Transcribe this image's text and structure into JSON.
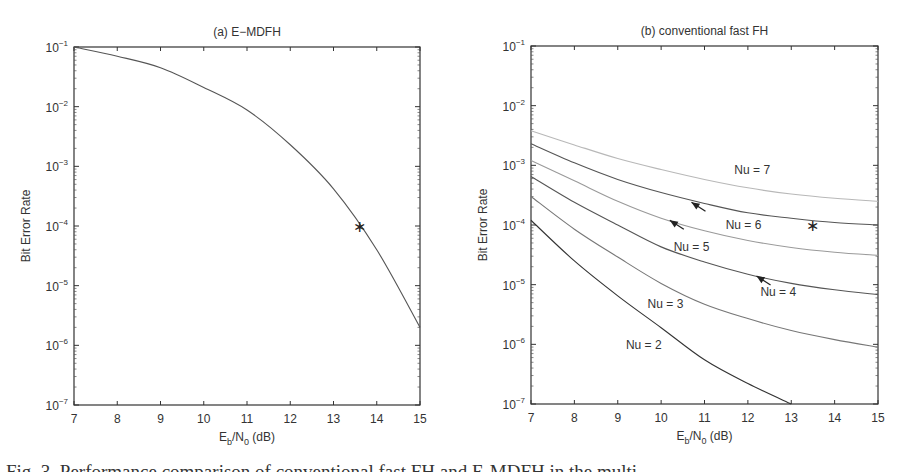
{
  "figure": {
    "caption_partial": "Fig. 3.  Performance comparison of conventional fast FH and E-MDFH in the multi"
  },
  "chart_data": [
    {
      "type": "line",
      "title": "(a) E−MDFH",
      "xlabel": "E_b/N_0 (dB)",
      "ylabel": "Bit Error Rate",
      "xlim": [
        7,
        15
      ],
      "ylim": [
        1e-07,
        0.1
      ],
      "yscale": "log",
      "grid": false,
      "xticks": [
        "7",
        "8",
        "9",
        "10",
        "11",
        "12",
        "13",
        "14",
        "15"
      ],
      "yticks": [
        "10^-1",
        "10^-2",
        "10^-3",
        "10^-4",
        "10^-5",
        "10^-6",
        "10^-7"
      ],
      "series": [
        {
          "name": "E-MDFH",
          "color": "#555555",
          "x": [
            7,
            8,
            9,
            10,
            11,
            12,
            13,
            14,
            15
          ],
          "values": [
            0.1,
            0.07,
            0.045,
            0.021,
            0.0088,
            0.0023,
            0.00042,
            4e-05,
            2e-06
          ]
        }
      ],
      "markers": [
        {
          "x": 13.6,
          "y": 0.0001,
          "symbol": "*"
        }
      ]
    },
    {
      "type": "line",
      "title": "(b) conventional fast FH",
      "xlabel": "E_b/N_0 (dB)",
      "ylabel": "Bit Error Rate",
      "xlim": [
        7,
        15
      ],
      "ylim": [
        1e-07,
        0.1
      ],
      "yscale": "log",
      "grid": false,
      "xticks": [
        "7",
        "8",
        "9",
        "10",
        "11",
        "12",
        "13",
        "14",
        "15"
      ],
      "yticks": [
        "10^-1",
        "10^-2",
        "10^-3",
        "10^-4",
        "10^-5",
        "10^-6",
        "10^-7"
      ],
      "series": [
        {
          "name": "Nu = 7",
          "color": "#b8b8b8",
          "x": [
            7,
            8,
            9,
            10,
            11,
            12,
            13,
            14,
            15
          ],
          "values": [
            0.0038,
            0.0022,
            0.0013,
            0.00085,
            0.00058,
            0.00042,
            0.00033,
            0.00028,
            0.00025
          ]
        },
        {
          "name": "Nu = 6",
          "color": "#555555",
          "x": [
            7,
            8,
            9,
            10,
            11,
            12,
            13,
            14,
            15
          ],
          "values": [
            0.0023,
            0.0011,
            0.00058,
            0.00035,
            0.00023,
            0.00016,
            0.00013,
            0.00011,
            0.0001
          ]
        },
        {
          "name": "Nu = 5",
          "color": "#9a9a9a",
          "x": [
            7,
            8,
            9,
            10,
            11,
            12,
            13,
            14,
            15
          ],
          "values": [
            0.0012,
            0.00055,
            0.00025,
            0.00013,
            8e-05,
            5.5e-05,
            4.2e-05,
            3.5e-05,
            3.1e-05
          ]
        },
        {
          "name": "Nu = 4",
          "color": "#555555",
          "x": [
            7,
            8,
            9,
            10,
            11,
            12,
            13,
            14,
            15
          ],
          "values": [
            0.00065,
            0.00024,
            0.0001,
            4.3e-05,
            2.4e-05,
            1.5e-05,
            1.05e-05,
            8.2e-06,
            6.8e-06
          ]
        },
        {
          "name": "Nu = 3",
          "color": "#777777",
          "x": [
            7,
            8,
            9,
            10,
            11,
            12,
            13,
            14,
            15
          ],
          "values": [
            0.0003,
            8.5e-05,
            2.9e-05,
            1.05e-05,
            4.7e-06,
            2.7e-06,
            1.7e-06,
            1.2e-06,
            9e-07
          ]
        },
        {
          "name": "Nu = 2",
          "color": "#333333",
          "x": [
            7,
            8,
            9,
            10,
            11,
            12,
            13
          ],
          "values": [
            0.00012,
            2.5e-05,
            6.5e-06,
            1.9e-06,
            5.5e-07,
            2.2e-07,
            1e-07
          ]
        }
      ],
      "annotations": [
        {
          "text": "Nu = 7",
          "x": 12.1,
          "y": 0.00085
        },
        {
          "text": "Nu = 6",
          "x": 11.9,
          "y": 0.0001,
          "arrow_to": [
            10.7,
            0.00024
          ]
        },
        {
          "text": "Nu = 5",
          "x": 10.7,
          "y": 4.3e-05,
          "arrow_to": [
            10.2,
            0.00012
          ]
        },
        {
          "text": "Nu = 4",
          "x": 12.7,
          "y": 7.5e-06,
          "arrow_to": [
            12.2,
            1.4e-05
          ]
        },
        {
          "text": "Nu = 3",
          "x": 10.1,
          "y": 4.8e-06
        },
        {
          "text": "Nu = 2",
          "x": 9.6,
          "y": 9.9e-07
        }
      ],
      "markers": [
        {
          "x": 13.5,
          "y": 0.0001,
          "symbol": "*"
        }
      ]
    }
  ]
}
